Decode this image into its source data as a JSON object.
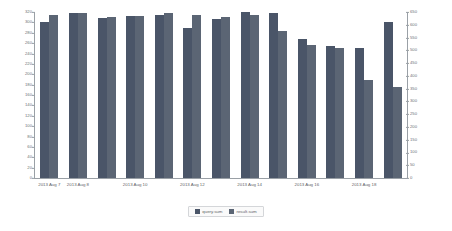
{
  "chart_data": {
    "type": "bar",
    "title": "",
    "subtitle": "",
    "xlabel": "",
    "ylabel": "",
    "grid": false,
    "legend_position": "bottom-center",
    "categories": [
      "2013 Aug 7",
      "2013 Aug 8",
      "2013 Aug 9",
      "2013 Aug 10",
      "2013 Aug 11",
      "2013 Aug 12",
      "2013 Aug 13",
      "2013 Aug 14",
      "2013 Aug 15",
      "2013 Aug 16",
      "2013 Aug 17",
      "2013 Aug 18",
      "2013 Aug 19"
    ],
    "x_tick_labels": [
      {
        "label": "2013 Aug 7",
        "category_index": 0
      },
      {
        "label": "2013 Aug 8",
        "category_index": 1
      },
      {
        "label": "2013 Aug 10",
        "category_index": 3
      },
      {
        "label": "2013 Aug 12",
        "category_index": 5
      },
      {
        "label": "2013 Aug 14",
        "category_index": 7
      },
      {
        "label": "2013 Aug 16",
        "category_index": 9
      },
      {
        "label": "2013 Aug 18",
        "category_index": 11
      }
    ],
    "series": [
      {
        "name": "query.sum",
        "axis": "left",
        "color": "#4a5568",
        "values": [
          300,
          318,
          308,
          312,
          315,
          290,
          306,
          320,
          318,
          268,
          254,
          250,
          300
        ]
      },
      {
        "name": "result.sum",
        "axis": "right",
        "color": "#5b6574",
        "values": [
          640,
          645,
          630,
          635,
          648,
          640,
          632,
          640,
          575,
          520,
          510,
          385,
          355
        ]
      }
    ],
    "left_axis": {
      "min": 0,
      "max": 320,
      "ticks": [
        0,
        20,
        40,
        60,
        80,
        100,
        120,
        140,
        160,
        180,
        200,
        220,
        240,
        260,
        280,
        300,
        320
      ]
    },
    "right_axis": {
      "min": 0,
      "max": 650,
      "ticks": [
        0,
        50,
        100,
        150,
        200,
        250,
        300,
        350,
        400,
        450,
        500,
        550,
        600,
        650
      ]
    }
  }
}
